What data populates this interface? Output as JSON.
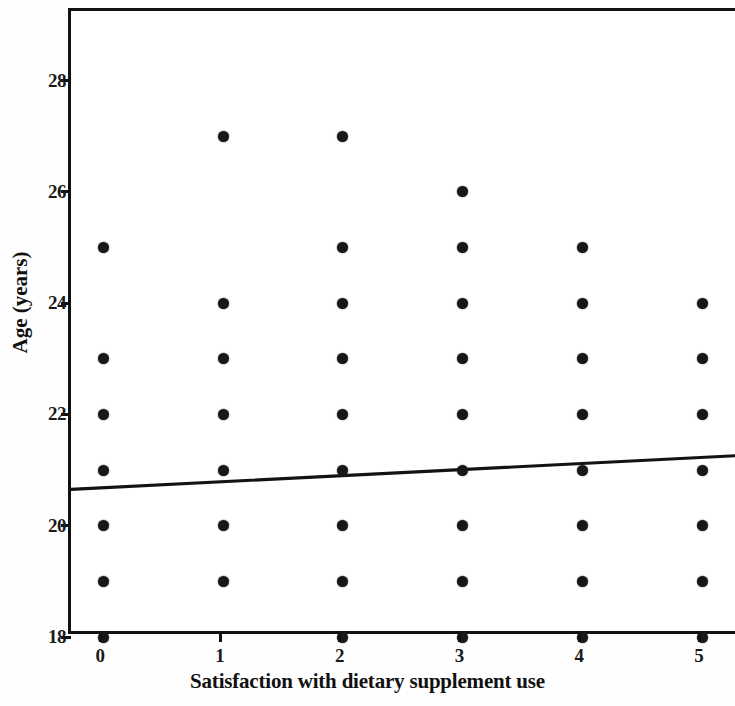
{
  "chart_data": {
    "type": "scatter",
    "title": "",
    "xlabel": "Satisfaction with dietary supplement use",
    "ylabel": "Age (years)",
    "xlim": [
      -0.27,
      5.3
    ],
    "ylim": [
      18,
      29.25
    ],
    "grid": false,
    "legend": null,
    "xticks": [
      "0",
      "1",
      "2",
      "3",
      "4",
      "5"
    ],
    "xtick_values": [
      0,
      1,
      2,
      3,
      4,
      5
    ],
    "yticks": [
      "18",
      "20",
      "22",
      "24",
      "26",
      "28"
    ],
    "ytick_values": [
      18,
      20,
      22,
      24,
      26,
      28
    ],
    "marker": {
      "shape": "circle",
      "color": "#171717",
      "size_px": 11,
      "filled": true
    },
    "points": [
      {
        "x": 0,
        "y": 25
      },
      {
        "x": 0,
        "y": 23
      },
      {
        "x": 0,
        "y": 22
      },
      {
        "x": 0,
        "y": 21
      },
      {
        "x": 0,
        "y": 20
      },
      {
        "x": 0,
        "y": 19
      },
      {
        "x": 0,
        "y": 18
      },
      {
        "x": 1,
        "y": 27
      },
      {
        "x": 1,
        "y": 24
      },
      {
        "x": 1,
        "y": 23
      },
      {
        "x": 1,
        "y": 22
      },
      {
        "x": 1,
        "y": 21
      },
      {
        "x": 1,
        "y": 20
      },
      {
        "x": 1,
        "y": 19
      },
      {
        "x": 2,
        "y": 27
      },
      {
        "x": 2,
        "y": 25
      },
      {
        "x": 2,
        "y": 24
      },
      {
        "x": 2,
        "y": 23
      },
      {
        "x": 2,
        "y": 22
      },
      {
        "x": 2,
        "y": 21
      },
      {
        "x": 2,
        "y": 20
      },
      {
        "x": 2,
        "y": 19
      },
      {
        "x": 2,
        "y": 18
      },
      {
        "x": 3,
        "y": 26
      },
      {
        "x": 3,
        "y": 25
      },
      {
        "x": 3,
        "y": 24
      },
      {
        "x": 3,
        "y": 23
      },
      {
        "x": 3,
        "y": 22
      },
      {
        "x": 3,
        "y": 21
      },
      {
        "x": 3,
        "y": 20
      },
      {
        "x": 3,
        "y": 19
      },
      {
        "x": 3,
        "y": 18
      },
      {
        "x": 4,
        "y": 25
      },
      {
        "x": 4,
        "y": 24
      },
      {
        "x": 4,
        "y": 23
      },
      {
        "x": 4,
        "y": 22
      },
      {
        "x": 4,
        "y": 21
      },
      {
        "x": 4,
        "y": 20
      },
      {
        "x": 4,
        "y": 19
      },
      {
        "x": 4,
        "y": 18
      },
      {
        "x": 5,
        "y": 24
      },
      {
        "x": 5,
        "y": 23
      },
      {
        "x": 5,
        "y": 22
      },
      {
        "x": 5,
        "y": 21
      },
      {
        "x": 5,
        "y": 20
      },
      {
        "x": 5,
        "y": 19
      },
      {
        "x": 5,
        "y": 18
      }
    ],
    "fit_line": {
      "name": "regression line",
      "color": "#131313",
      "x": [
        -0.27,
        5.3
      ],
      "y": [
        20.57,
        21.18
      ]
    }
  }
}
